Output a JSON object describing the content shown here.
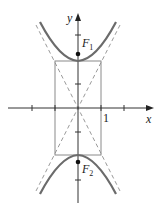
{
  "diagram": {
    "type": "hyperbola",
    "equation": "y^2/4 - x^2 = 1",
    "axes": {
      "x_label": "x",
      "y_label": "y",
      "x_tick_label": "1"
    },
    "foci": [
      {
        "label": "F",
        "sub": "1"
      },
      {
        "label": "F",
        "sub": "2"
      }
    ],
    "colors": {
      "curve": "#6b6b6b",
      "axis": "#333333",
      "asymptote": "#9a9a9a",
      "box": "#8a8a8a"
    }
  }
}
